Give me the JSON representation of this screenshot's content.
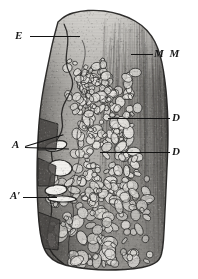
{
  "figure": {
    "kind": "histological-section-illustration",
    "width_px": 198,
    "height_px": 279,
    "background_color": "#ffffff",
    "ink_color": "#121212"
  },
  "labels": [
    {
      "id": "E",
      "text": "E",
      "meaning": "epithelium",
      "position": {
        "x": 15,
        "y": 30
      },
      "leaders": [
        {
          "x": 30,
          "y": 36,
          "length": 50,
          "angle_deg": 0
        }
      ]
    },
    {
      "id": "MM",
      "text": "M M",
      "meaning": "muscularis-mucosae",
      "position": {
        "x": 154,
        "y": 48
      },
      "leaders": [
        {
          "x": 131,
          "y": 54,
          "length": 22,
          "angle_deg": 0
        }
      ]
    },
    {
      "id": "D1",
      "text": "D",
      "meaning": "gland-duct-upper",
      "position": {
        "x": 172,
        "y": 112
      },
      "leaders": [
        {
          "x": 108,
          "y": 118,
          "length": 62,
          "angle_deg": 0
        }
      ]
    },
    {
      "id": "D2",
      "text": "D",
      "meaning": "gland-duct-lower",
      "position": {
        "x": 172,
        "y": 146
      },
      "leaders": [
        {
          "x": 100,
          "y": 152,
          "length": 70,
          "angle_deg": 0
        }
      ]
    },
    {
      "id": "A",
      "text": "A",
      "meaning": "alveolus-crypt-pair",
      "position": {
        "x": 12,
        "y": 139
      },
      "leaders": [
        {
          "x": 25,
          "y": 146,
          "length": 40,
          "angle_deg": -17
        },
        {
          "x": 25,
          "y": 147,
          "length": 44,
          "angle_deg": 2
        }
      ]
    },
    {
      "id": "Aprime",
      "text": "A′",
      "meaning": "alveolus-crypt-lower",
      "position": {
        "x": 10,
        "y": 190
      },
      "leaders": [
        {
          "x": 23,
          "y": 197,
          "length": 34,
          "angle_deg": 0
        }
      ]
    }
  ],
  "specimen": {
    "outline_points": [
      [
        58,
        22
      ],
      [
        66,
        15
      ],
      [
        80,
        11
      ],
      [
        96,
        10
      ],
      [
        112,
        12
      ],
      [
        128,
        17
      ],
      [
        142,
        25
      ],
      [
        152,
        36
      ],
      [
        158,
        48
      ],
      [
        162,
        62
      ],
      [
        165,
        80
      ],
      [
        167,
        100
      ],
      [
        168,
        122
      ],
      [
        168,
        145
      ],
      [
        167,
        168
      ],
      [
        166,
        190
      ],
      [
        165,
        212
      ],
      [
        164,
        232
      ],
      [
        163,
        248
      ],
      [
        160,
        260
      ],
      [
        150,
        266
      ],
      [
        134,
        269
      ],
      [
        116,
        270
      ],
      [
        98,
        270
      ],
      [
        80,
        268
      ],
      [
        64,
        265
      ],
      [
        52,
        260
      ],
      [
        44,
        250
      ],
      [
        40,
        234
      ],
      [
        38,
        212
      ],
      [
        37,
        188
      ],
      [
        37,
        162
      ],
      [
        38,
        136
      ],
      [
        40,
        110
      ],
      [
        44,
        84
      ],
      [
        49,
        60
      ],
      [
        53,
        40
      ]
    ],
    "epithelium_band": {
      "name": "surface-epithelium",
      "tone": "#8d8d8d",
      "description": "Darker band along upper-left margin of the section"
    },
    "muscularis_band": {
      "name": "muscularis-mucosae",
      "tone": "#7a7a7a",
      "description": "Vertically striated dense band occupying the right third"
    },
    "gland_field": {
      "name": "glandular-zone",
      "description": "Mid zone packed with rounded pale gland acini outlined in dark ink"
    },
    "crypt_lumina": [
      {
        "cx": 56,
        "cy": 146,
        "rx": 11,
        "ry": 5,
        "rot": -12
      },
      {
        "cx": 60,
        "cy": 168,
        "rx": 12,
        "ry": 8,
        "rot": 4
      },
      {
        "cx": 56,
        "cy": 190,
        "rx": 11,
        "ry": 5,
        "rot": -6
      },
      {
        "cx": 62,
        "cy": 199,
        "rx": 14,
        "ry": 3,
        "rot": 1
      }
    ]
  },
  "tones": {
    "paper": "#ffffff",
    "light_tissue": "#b8b6b2",
    "mid_tissue": "#9a9894",
    "dark_tissue": "#6e6c69",
    "deep_shadow": "#४f4e4b",
    "outline": "#2b2b2b"
  }
}
